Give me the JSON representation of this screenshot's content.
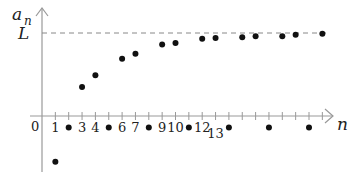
{
  "chart_data": {
    "type": "scatter",
    "title": "",
    "xlabel": "n",
    "ylabel": "a_n",
    "ylabel_display": {
      "base": "a",
      "sub": "n"
    },
    "origin_label": "0",
    "limit_label": "L",
    "limit_value": 1,
    "xlim": [
      0,
      22
    ],
    "ylim": [
      -0.7,
      1.2
    ],
    "grid": false,
    "legend": null,
    "tick_labels": [
      {
        "x": 1,
        "label": "1"
      },
      {
        "x": 3,
        "label": "3"
      },
      {
        "x": 4,
        "label": "4"
      },
      {
        "x": 6,
        "label": "6"
      },
      {
        "x": 7,
        "label": "7"
      },
      {
        "x": 9,
        "label": "9"
      },
      {
        "x": 10,
        "label": "10"
      },
      {
        "x": 12,
        "label": "12"
      },
      {
        "x": 13,
        "label": "13",
        "lowered": true
      }
    ],
    "ticks": [
      1,
      2,
      3,
      4,
      5,
      6,
      7,
      8,
      9,
      10,
      11,
      12,
      13,
      14,
      15,
      16,
      17,
      18,
      19,
      20,
      21
    ],
    "points": [
      {
        "n": 1,
        "a": -0.55
      },
      {
        "n": 2,
        "a": -0.14
      },
      {
        "n": 3,
        "a": 0.35
      },
      {
        "n": 4,
        "a": 0.49
      },
      {
        "n": 5,
        "a": -0.14
      },
      {
        "n": 6,
        "a": 0.69
      },
      {
        "n": 7,
        "a": 0.75
      },
      {
        "n": 8,
        "a": -0.14
      },
      {
        "n": 9,
        "a": 0.86
      },
      {
        "n": 10,
        "a": 0.88
      },
      {
        "n": 11,
        "a": -0.14
      },
      {
        "n": 12,
        "a": 0.93
      },
      {
        "n": 13,
        "a": 0.94
      },
      {
        "n": 14,
        "a": -0.14
      },
      {
        "n": 15,
        "a": 0.95
      },
      {
        "n": 16,
        "a": 0.96
      },
      {
        "n": 17,
        "a": -0.14
      },
      {
        "n": 18,
        "a": 0.96
      },
      {
        "n": 19,
        "a": 0.98
      },
      {
        "n": 20,
        "a": -0.14
      },
      {
        "n": 21,
        "a": 0.99
      }
    ],
    "annotations": [
      "dashed horizontal line at L"
    ]
  },
  "colors": {
    "axis": "#999999",
    "points": "#111111",
    "dashed_line": "#888888",
    "text": "#222222"
  }
}
